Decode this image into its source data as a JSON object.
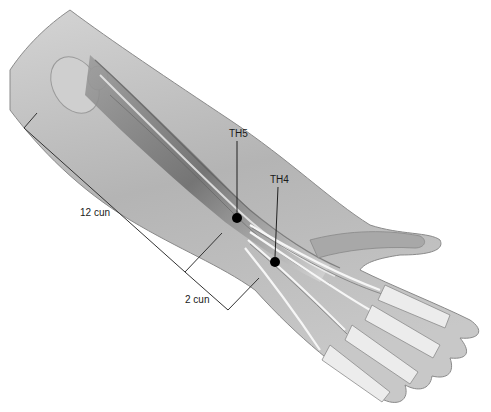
{
  "figure": {
    "points": [
      {
        "id": "TH5",
        "label": "TH5",
        "x": 237,
        "y": 218,
        "label_x": 229,
        "label_y": 129
      },
      {
        "id": "TH4",
        "label": "TH4",
        "x": 275,
        "y": 262,
        "label_x": 270,
        "label_y": 175
      }
    ],
    "measurements": [
      {
        "label": "12 cun",
        "label_x": 80,
        "label_y": 208
      },
      {
        "label": "2 cun",
        "label_x": 185,
        "label_y": 295
      }
    ],
    "colors": {
      "skin_fill": "#bdbdbd",
      "skin_edge": "#8a8a8a",
      "bone_fill": "#e6e6e6",
      "muscle_dark": "#6e6e6e",
      "tendon_light": "#f4f4f4",
      "point": "#000000",
      "line": "#333333"
    }
  }
}
